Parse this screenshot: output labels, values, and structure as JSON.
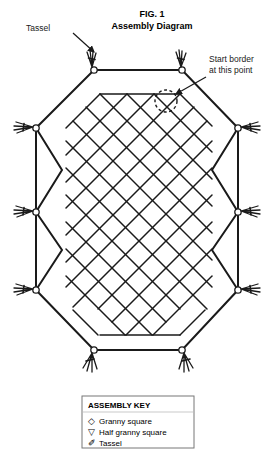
{
  "figure": {
    "title_line1": "FIG. 1",
    "title_line2": "Assembly Diagram"
  },
  "annotations": {
    "tassel_label": "Tassel",
    "start_border_line1": "Start border",
    "start_border_line2": "at this point"
  },
  "legend": {
    "title": "ASSEMBLY KEY",
    "items": [
      {
        "glyph": "◇",
        "glyph_name": "diamond-glyph",
        "label": "Granny square"
      },
      {
        "glyph": "▽",
        "glyph_name": "triangle-down-glyph",
        "label": "Half granny square"
      },
      {
        "glyph": "✐",
        "glyph_name": "tassel-glyph",
        "label": "Tassel"
      }
    ]
  },
  "colors": {
    "line": "#1a1a1a",
    "background": "#ffffff",
    "legend_border": "#777777",
    "legend_fill": "#ffffff"
  },
  "diagram": {
    "tassel_count": 10,
    "outline_vertices": [
      {
        "x": 94,
        "y": 70,
        "name": "top-left-tassel-point"
      },
      {
        "x": 182,
        "y": 70,
        "name": "top-right-tassel-point"
      },
      {
        "x": 238,
        "y": 128,
        "name": "right-upper-tassel-point"
      },
      {
        "x": 238,
        "y": 212,
        "name": "right-middle-tassel-point"
      },
      {
        "x": 238,
        "y": 290,
        "name": "right-lower-tassel-point"
      },
      {
        "x": 182,
        "y": 350,
        "name": "bottom-right-tassel-point"
      },
      {
        "x": 94,
        "y": 350,
        "name": "bottom-left-tassel-point"
      },
      {
        "x": 36,
        "y": 290,
        "name": "left-lower-tassel-point"
      },
      {
        "x": 36,
        "y": 212,
        "name": "left-middle-tassel-point"
      },
      {
        "x": 36,
        "y": 128,
        "name": "left-upper-tassel-point"
      }
    ],
    "start_marker": {
      "x": 166,
      "y": 101,
      "r": 11
    },
    "lattice": {
      "cell": 27,
      "top_y": 94,
      "bottom_y": 335,
      "left_x": 66,
      "right_x": 212
    }
  }
}
